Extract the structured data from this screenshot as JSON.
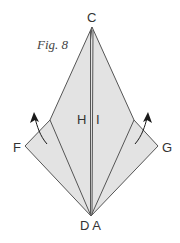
{
  "figure": {
    "caption": "Fig. 8",
    "labels": {
      "C": "C",
      "H": "H",
      "I": "I",
      "F": "F",
      "G": "G",
      "DA": "D A"
    },
    "colors": {
      "fill": "#e3e3e3",
      "stroke": "#555555",
      "arrow": "#1a1a1a",
      "text": "#333333"
    },
    "arrows": [
      {
        "name": "left-fold-arrow",
        "direction": "up"
      },
      {
        "name": "right-fold-arrow",
        "direction": "up"
      }
    ]
  }
}
